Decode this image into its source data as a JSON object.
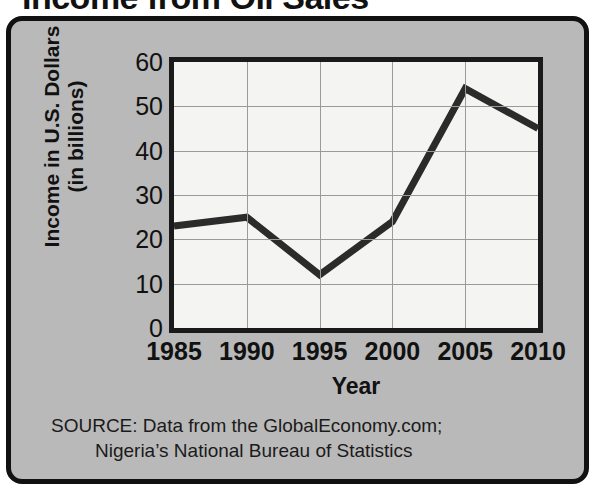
{
  "title": "Income from Oil Sales",
  "axis": {
    "y_label_line1": "Income in U.S. Dollars",
    "y_label_line2": "(in billions)",
    "x_label": "Year"
  },
  "source": {
    "line1": "SOURCE: Data from the GlobalEconomy.com;",
    "line2": "Nigeria’s National Bureau of Statistics"
  },
  "colors": {
    "panel_background": "#b9b9b9",
    "plot_background": "#f4f4f2",
    "frame_border": "#111111",
    "gridline": "#9a9a9a",
    "series_line": "#2b2b2b"
  },
  "chart_data": {
    "type": "line",
    "title": "Income from Oil Sales",
    "xlabel": "Year",
    "ylabel": "Income in U.S. Dollars (in billions)",
    "x": [
      1985,
      1990,
      1995,
      2000,
      2005,
      2010
    ],
    "categories": [
      "1985",
      "1990",
      "1995",
      "2000",
      "2005",
      "2010"
    ],
    "values": [
      23,
      25,
      12,
      24,
      54,
      45
    ],
    "series": [
      {
        "name": "Income from Oil Sales",
        "values": [
          23,
          25,
          12,
          24,
          54,
          45
        ]
      }
    ],
    "ylim": [
      0,
      60
    ],
    "xlim": [
      1985,
      2010
    ],
    "yticks": [
      0,
      10,
      20,
      30,
      40,
      50,
      60
    ],
    "ytick_labels": [
      "0",
      "10",
      "20",
      "30",
      "40",
      "50",
      "60"
    ],
    "xticks": [
      1985,
      1990,
      1995,
      2000,
      2005,
      2010
    ],
    "xtick_labels": [
      "1985",
      "1990",
      "1995",
      "2000",
      "2005",
      "2010"
    ],
    "grid": true,
    "legend": false,
    "legend_position": "none",
    "annotations": [
      "SOURCE: Data from the GlobalEconomy.com;",
      "Nigeria’s National Bureau of Statistics"
    ]
  }
}
